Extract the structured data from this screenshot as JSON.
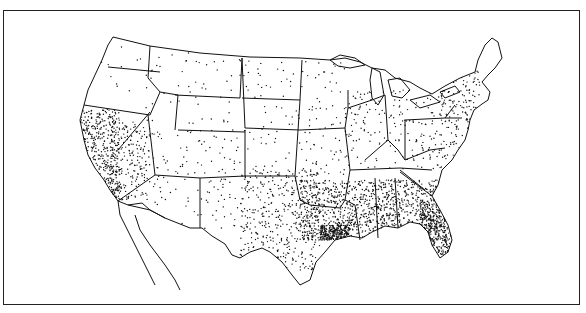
{
  "map": {
    "type": "dot-density",
    "region": "Contiguous United States",
    "colors": {
      "background": "#ffffff",
      "ink": "#111111",
      "frame": "#222222"
    },
    "density_zones": [
      {
        "name": "Pacific coast (California)",
        "density": "very high"
      },
      {
        "name": "Gulf coast (Texas to Florida)",
        "density": "very high"
      },
      {
        "name": "Southeast (Louisiana, Mississippi, Alabama, Georgia, Florida, South Carolina)",
        "density": "high"
      },
      {
        "name": "Mid-Atlantic & Northeast coast",
        "density": "medium"
      },
      {
        "name": "Midwest & Plains",
        "density": "low"
      },
      {
        "name": "Mountain West & Northern Plains",
        "density": "very low"
      }
    ]
  }
}
